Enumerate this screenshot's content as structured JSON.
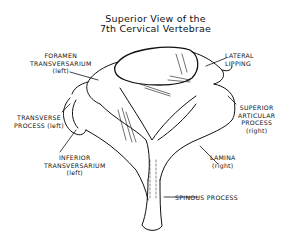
{
  "title": {
    "line1": "Superior View of the",
    "line2": "7th Cervical Vertebrae"
  },
  "labels": {
    "foramen_transversarium": {
      "l1": "FORAMEN",
      "l2": "TRANSVERSARIUM",
      "l3": "(left)"
    },
    "lateral_lipping": {
      "l1": "LATERAL",
      "l2": "LIPPING"
    },
    "transverse_process": {
      "l1": "TRANSVERSE",
      "l2": "PROCESS (left)"
    },
    "superior_articular_process": {
      "l1": "SUPERIOR",
      "l2": "ARTICULAR",
      "l3": "PROCESS",
      "l4": "(right)"
    },
    "inferior_transversarium": {
      "l1": "INFERIOR",
      "l2": "TRANSVERSARIUM",
      "l3": "(left)"
    },
    "lamina": {
      "l1": "LAMINA",
      "l2": "(right)"
    },
    "spinous_process": {
      "l1": "SPINOUS PROCESS"
    }
  },
  "colors": {
    "ink": "#111111",
    "background": "#ffffff"
  }
}
